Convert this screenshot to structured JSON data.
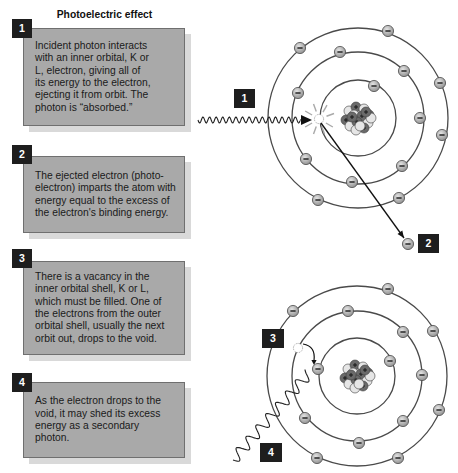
{
  "title": "Photoelectric effect",
  "colors": {
    "box-fill": "#a9a9a9",
    "box-border": "#6f6f6f",
    "box-shadow": "#d9d9d9",
    "label-bg": "#1e1e1e",
    "label-fg": "#ffffff",
    "orbit": "#4a4a4a",
    "nucleon-dark": "#6a6a6a",
    "nucleon-light": "#e6e6e6"
  },
  "steps": [
    {
      "number": "1",
      "lines": [
        "Incident photon interacts",
        "with an inner orbital, K or",
        "L, electron, giving all of",
        "its energy to the electron,",
        "ejecting it from orbit. The",
        "photon is “absorbed.”"
      ]
    },
    {
      "number": "2",
      "lines": [
        "The ejected electron (photo-",
        "electron) imparts the atom with",
        "energy equal to the excess of",
        "the electron's binding energy."
      ]
    },
    {
      "number": "3",
      "lines": [
        "There is a vacancy in the",
        "inner orbital shell, K or L,",
        "which must be filled. One of",
        "the electrons from the outer",
        "orbital shell, usually the next",
        "orbit out, drops to the void."
      ]
    },
    {
      "number": "4",
      "lines": [
        "As the electron drops to the",
        "void, it may shed its excess",
        "energy as a secondary",
        "photon."
      ]
    }
  ],
  "diagram": {
    "labels": [
      {
        "text": "1",
        "x": 234,
        "y": 89
      },
      {
        "text": "2",
        "x": 418,
        "y": 234
      },
      {
        "text": "3",
        "x": 262,
        "y": 329
      },
      {
        "text": "4",
        "x": 260,
        "y": 443
      }
    ],
    "nucleons": [
      [
        -9,
        -7,
        "light"
      ],
      [
        -2,
        -11,
        "dark"
      ],
      [
        6,
        -9,
        "light"
      ],
      [
        11,
        -3,
        "dark"
      ],
      [
        -12,
        2,
        "dark"
      ],
      [
        -4,
        -3,
        "light"
      ],
      [
        4,
        -2,
        "dark"
      ],
      [
        10,
        5,
        "light"
      ],
      [
        -8,
        8,
        "light"
      ],
      [
        -1,
        4,
        "dark"
      ],
      [
        6,
        10,
        "dark"
      ],
      [
        -2,
        12,
        "light"
      ],
      [
        13,
        0,
        "light"
      ],
      [
        -6,
        -1,
        "dark"
      ],
      [
        2,
        8,
        "light"
      ],
      [
        8,
        -6,
        "dark"
      ]
    ],
    "atoms": [
      {
        "name": "atom-ejection",
        "center": [
          358,
          118
        ],
        "radii": [
          38,
          66,
          90
        ],
        "electrons": [
          [
            388,
            31
          ],
          [
            300,
            48
          ],
          [
            340,
            52
          ],
          [
            440,
            83
          ],
          [
            404,
            71
          ],
          [
            298,
            93
          ],
          [
            374,
            86
          ],
          [
            420,
            118
          ],
          [
            442,
            135
          ],
          [
            306,
            159
          ],
          [
            402,
            166
          ],
          [
            352,
            182
          ],
          [
            318,
            200
          ],
          [
            399,
            198
          ]
        ],
        "vacancy": [
          319,
          119
        ]
      },
      {
        "name": "atom-cascade",
        "center": [
          357,
          376
        ],
        "radii": [
          38,
          65,
          90
        ],
        "electrons": [
          [
            388,
            289
          ],
          [
            293,
            311
          ],
          [
            348,
            311
          ],
          [
            403,
            332
          ],
          [
            433,
            331
          ],
          [
            390,
            361
          ],
          [
            318,
            369
          ],
          [
            422,
            375
          ],
          [
            439,
            410
          ],
          [
            305,
            418
          ],
          [
            403,
            421
          ],
          [
            359,
            443
          ],
          [
            317,
            458
          ],
          [
            398,
            458
          ]
        ],
        "vacancy": [
          298,
          348
        ]
      }
    ],
    "ejected_electron": [
      408,
      244
    ],
    "incident_photon": {
      "from": [
        198,
        120
      ],
      "to": [
        300,
        120
      ],
      "period": 6.6,
      "amp": 3,
      "arrow_tip": [
        312,
        120
      ]
    },
    "ejection_arrow": {
      "from": [
        321,
        123
      ],
      "to": [
        404,
        238
      ]
    },
    "secondary_photon": {
      "from": [
        233,
        460
      ],
      "to": [
        309,
        373
      ],
      "period": 15,
      "amp": 5.5
    },
    "drop_arrow": {
      "path": "M303,344 Q316,346 314,361",
      "tip": [
        314,
        365
      ]
    }
  }
}
